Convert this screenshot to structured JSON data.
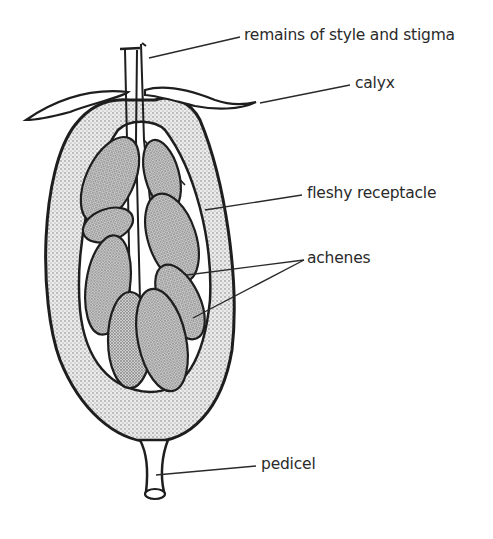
{
  "figure": {
    "colors": {
      "outline": "#1e1e1e",
      "receptacle_fill": "#d6d6d6",
      "achene_fill": "#bdbdbd",
      "background": "#ffffff",
      "label_text": "#2a2a2a"
    }
  },
  "labels": [
    {
      "id": "style-stigma",
      "text": "remains of style and stigma"
    },
    {
      "id": "calyx",
      "text": "calyx"
    },
    {
      "id": "receptacle",
      "text": "fleshy receptacle"
    },
    {
      "id": "achenes",
      "text": "achenes"
    },
    {
      "id": "pedicel",
      "text": "pedicel"
    }
  ]
}
